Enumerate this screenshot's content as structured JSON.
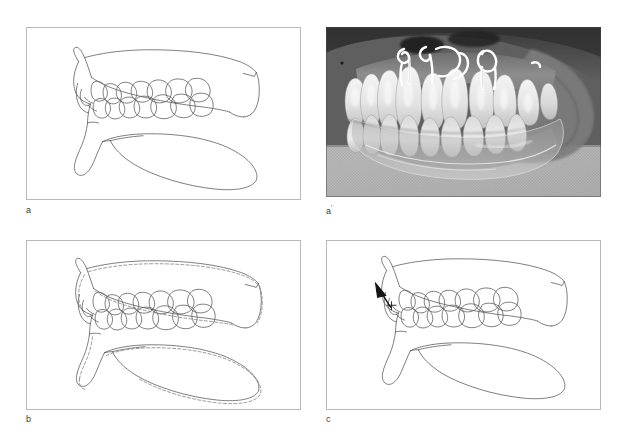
{
  "figure": {
    "background_color": "#ffffff",
    "line_color": "#5a5a5a",
    "panels": [
      {
        "id": "a",
        "label": "a",
        "type": "line-drawing",
        "description": "Lateral view line drawing of maxillary and mandibular dental arches in occlusion, teeth outlined, before treatment"
      },
      {
        "id": "a-prime",
        "label": "a'",
        "label_base": "a",
        "label_prime": "'",
        "type": "photograph",
        "description": "Intraoral lateral photograph of dental study casts wearing a clear removable appliance with wire clasps over the maxillary anterior teeth"
      },
      {
        "id": "b",
        "label": "b",
        "type": "line-drawing",
        "description": "Lateral line drawing with superimposed dashed outline showing appliance or post-treatment tracing overlay"
      },
      {
        "id": "c",
        "label": "c",
        "type": "line-drawing",
        "description": "Lateral line drawing with a solid black arrow at the anterior incisor region indicating direction of tooth movement"
      }
    ],
    "caption": ""
  }
}
